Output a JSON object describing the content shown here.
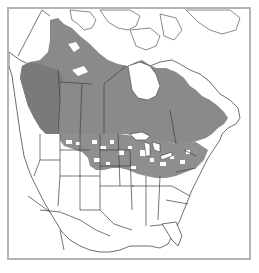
{
  "map": {
    "title": "",
    "region": "North America",
    "type": "species range map",
    "legend": [],
    "colors": {
      "background": "#ffffff",
      "frame": "#b4b4b4",
      "range_fill": "#8a8a8a",
      "range_fill_dark": "#7a7a7a",
      "outline": "#3c3c3c"
    },
    "shaded_areas": [
      "British Columbia",
      "Alberta",
      "Saskatchewan",
      "Manitoba",
      "southern Northwest Territories",
      "Ontario",
      "Quebec",
      "Atlantic Canada",
      "northern Great Plains (patchy)",
      "Upper Midwest (patchy)",
      "Great Lakes region (patchy)",
      "Northeastern United States (patchy)",
      "Pacific Northwest coast"
    ],
    "unshaded_areas": [
      "Alaska",
      "Yukon",
      "Nunavut / Arctic islands",
      "Greenland",
      "Western United States",
      "Southern United States",
      "Mexico"
    ]
  }
}
